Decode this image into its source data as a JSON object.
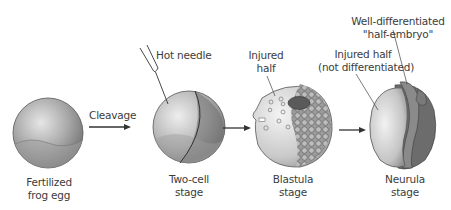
{
  "diagram": {
    "stages": [
      {
        "id": "fertilized",
        "label_line1": "Fertilized",
        "label_line2": "frog egg"
      },
      {
        "id": "two-cell",
        "label_line1": "Two-cell",
        "label_line2": "stage"
      },
      {
        "id": "blastula",
        "label_line1": "Blastula",
        "label_line2": "stage"
      },
      {
        "id": "neurula",
        "label_line1": "Neurula",
        "label_line2": "stage"
      }
    ],
    "arrows": [
      {
        "from": "fertilized",
        "to": "two-cell",
        "label": "Cleavage"
      },
      {
        "from": "two-cell",
        "to": "blastula",
        "label": ""
      },
      {
        "from": "blastula",
        "to": "neurula",
        "label": ""
      }
    ],
    "annotations": {
      "hot_needle": "Hot needle",
      "blastula_injured_line1": "Injured",
      "blastula_injured_line2": "half",
      "neurula_injured_line1": "Injured half",
      "neurula_injured_line2": "(not differentiated)",
      "half_embryo_line1": "Well-differentiated",
      "half_embryo_line2": "\"half-embryo\""
    },
    "colors": {
      "egg_shade": "#8a8a8a",
      "egg_light": "#d8d8d8",
      "dark_patch": "#5a5a5a",
      "line": "#333333"
    }
  }
}
